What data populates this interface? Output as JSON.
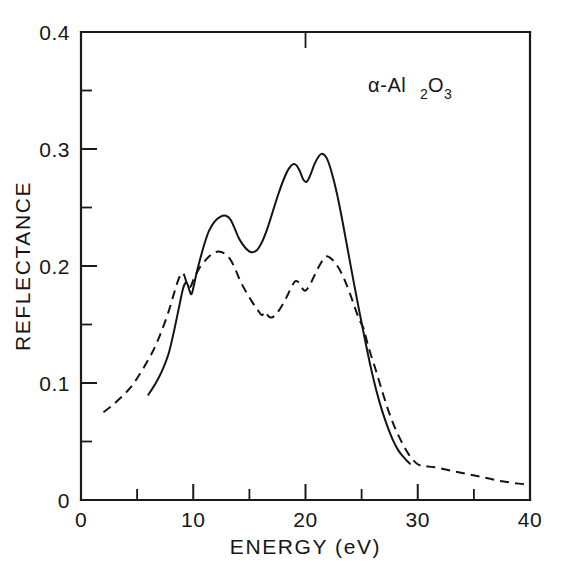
{
  "chart_data": {
    "type": "line",
    "title": "",
    "xlabel": "ENERGY (eV)",
    "ylabel": "REFLECTANCE",
    "xlim": [
      0,
      40
    ],
    "ylim": [
      0,
      0.4
    ],
    "xticks": [
      "0",
      "10",
      "20",
      "30",
      "40"
    ],
    "xtick_values": [
      0,
      10,
      20,
      30,
      40
    ],
    "xminor_values": [
      5,
      15,
      25,
      35
    ],
    "yticks": [
      "0",
      "0.1",
      "0.2",
      "0.3",
      "0.4"
    ],
    "ytick_values": [
      0,
      0.1,
      0.2,
      0.3,
      0.4
    ],
    "yminor_values": [
      0.05,
      0.15,
      0.25,
      0.35
    ],
    "grid": false,
    "legend_position": "none",
    "annotations": [
      {
        "text": "α-Al",
        "sub1": "2",
        "mid": "O",
        "sub2": "3",
        "x": 25.5,
        "y": 0.355
      }
    ],
    "series": [
      {
        "name": "solid-curve",
        "style": "solid",
        "x": [
          6.0,
          6.6,
          7.2,
          7.8,
          8.3,
          8.8,
          9.1,
          9.35,
          9.5,
          9.7,
          9.85,
          10.0,
          10.2,
          10.45,
          10.7,
          11.0,
          11.4,
          11.9,
          12.4,
          12.9,
          13.3,
          13.7,
          14.1,
          14.6,
          15.1,
          15.6,
          16.1,
          16.6,
          17.1,
          17.6,
          18.1,
          18.5,
          18.9,
          19.2,
          19.5,
          19.8,
          20.1,
          20.4,
          20.8,
          21.2,
          21.5,
          21.9,
          22.3,
          22.8,
          23.3,
          23.8,
          24.3,
          24.8,
          25.3,
          25.8,
          26.3,
          26.8,
          27.3,
          27.8,
          28.3,
          28.8,
          29.3
        ],
        "y": [
          0.09,
          0.099,
          0.11,
          0.125,
          0.145,
          0.168,
          0.181,
          0.186,
          0.184,
          0.178,
          0.176,
          0.181,
          0.19,
          0.2,
          0.209,
          0.219,
          0.23,
          0.238,
          0.242,
          0.243,
          0.24,
          0.232,
          0.223,
          0.216,
          0.212,
          0.213,
          0.22,
          0.232,
          0.247,
          0.262,
          0.275,
          0.283,
          0.287,
          0.286,
          0.281,
          0.274,
          0.272,
          0.277,
          0.287,
          0.294,
          0.296,
          0.292,
          0.281,
          0.262,
          0.238,
          0.212,
          0.186,
          0.161,
          0.137,
          0.114,
          0.094,
          0.077,
          0.063,
          0.051,
          0.042,
          0.036,
          0.031
        ]
      },
      {
        "name": "dashed-curve",
        "style": "dashed",
        "x": [
          2.0,
          2.8,
          3.6,
          4.4,
          5.2,
          6.0,
          6.6,
          7.2,
          7.8,
          8.3,
          8.7,
          9.0,
          9.2,
          9.4,
          9.6,
          9.8,
          10.0,
          10.3,
          10.6,
          11.0,
          11.5,
          12.0,
          12.5,
          13.0,
          13.4,
          13.8,
          14.2,
          14.7,
          15.2,
          15.7,
          16.1,
          16.4,
          16.7,
          17.0,
          17.4,
          17.9,
          18.4,
          18.8,
          19.1,
          19.4,
          19.7,
          20.0,
          20.4,
          20.9,
          21.4,
          21.8,
          22.2,
          22.7,
          23.2,
          23.7,
          24.2,
          24.6,
          24.9,
          25.2,
          25.6,
          26.2,
          26.8,
          27.4,
          28.0,
          28.6,
          29.2,
          29.7,
          30.1,
          30.6,
          31.5,
          33.0,
          34.5,
          36.0,
          37.5,
          39.0,
          40.0
        ],
        "y": [
          0.075,
          0.081,
          0.088,
          0.096,
          0.107,
          0.12,
          0.131,
          0.145,
          0.161,
          0.177,
          0.189,
          0.194,
          0.192,
          0.186,
          0.182,
          0.183,
          0.188,
          0.194,
          0.199,
          0.204,
          0.209,
          0.212,
          0.212,
          0.209,
          0.204,
          0.196,
          0.187,
          0.178,
          0.17,
          0.163,
          0.158,
          0.161,
          0.157,
          0.156,
          0.159,
          0.166,
          0.175,
          0.183,
          0.187,
          0.186,
          0.181,
          0.179,
          0.184,
          0.194,
          0.203,
          0.208,
          0.207,
          0.202,
          0.194,
          0.183,
          0.17,
          0.159,
          0.152,
          0.146,
          0.131,
          0.113,
          0.094,
          0.076,
          0.061,
          0.049,
          0.039,
          0.033,
          0.03,
          0.029,
          0.028,
          0.025,
          0.022,
          0.019,
          0.016,
          0.014,
          0.013
        ]
      }
    ]
  },
  "axis": {
    "ylabel": "REFLECTANCE",
    "xlabel": "ENERGY (eV)",
    "ytick_0": "0",
    "ytick_1": "0.1",
    "ytick_2": "0.2",
    "ytick_3": "0.3",
    "ytick_4": "0.4",
    "xtick_0": "0",
    "xtick_1": "10",
    "xtick_2": "20",
    "xtick_3": "30",
    "xtick_4": "40"
  },
  "annotation": {
    "alpha_prefix": "α-Al",
    "sub_2": "2",
    "oxygen": "O",
    "sub_3": "3"
  }
}
